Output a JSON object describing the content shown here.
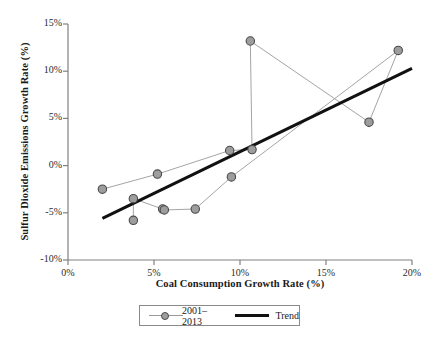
{
  "chart_data": {
    "type": "scatter",
    "title": "",
    "xlabel": "Coal Consumption Growth Rate (%)",
    "ylabel": "Sulfur Dioxide Emissions Growth Rate (%)",
    "xlim": [
      0,
      20
    ],
    "ylim": [
      -10,
      15
    ],
    "xticks": [
      "0%",
      "5%",
      "10%",
      "15%",
      "20%"
    ],
    "xtick_values": [
      0,
      5,
      10,
      15,
      20
    ],
    "yticks": [
      "-10%",
      "-5%",
      "0%",
      "5%",
      "10%",
      "15%"
    ],
    "ytick_values": [
      -10,
      -5,
      0,
      5,
      10,
      15
    ],
    "grid": false,
    "legend_position": "bottom",
    "series": [
      {
        "name": "2001-2013",
        "type": "scatter-connected",
        "marker": "circle",
        "marker_color": "#9d9d9d",
        "marker_edge_color": "#4a4a4a",
        "line_color": "#9a9a9a",
        "points": [
          {
            "x": 2.0,
            "y": -2.5
          },
          {
            "x": 5.2,
            "y": -0.9
          },
          {
            "x": 9.4,
            "y": 1.6
          },
          {
            "x": 3.8,
            "y": -3.5
          },
          {
            "x": 5.5,
            "y": -4.6
          },
          {
            "x": 5.6,
            "y": -4.7
          },
          {
            "x": 3.8,
            "y": -5.8
          },
          {
            "x": 7.4,
            "y": -4.6
          },
          {
            "x": 9.5,
            "y": -1.2
          },
          {
            "x": 10.7,
            "y": 1.7
          },
          {
            "x": 10.6,
            "y": 13.2
          },
          {
            "x": 17.5,
            "y": 4.6
          },
          {
            "x": 19.2,
            "y": 12.2
          }
        ],
        "path_order": [
          0,
          1,
          2,
          9,
          10,
          11,
          12,
          8,
          7,
          5,
          4,
          3,
          6
        ]
      },
      {
        "name": "Trend",
        "type": "line",
        "color": "#111111",
        "width": 3,
        "x0": 2.0,
        "y0": -5.6,
        "x1": 20.0,
        "y1": 10.3
      }
    ]
  },
  "legend": {
    "series_label": "2001–2013",
    "trend_label": "Trend"
  },
  "axes": {
    "x_axis_label": "Coal Consumption Growth Rate (%)",
    "y_axis_label": "Sulfur Dioxide Emissions Growth Rate (%)"
  }
}
